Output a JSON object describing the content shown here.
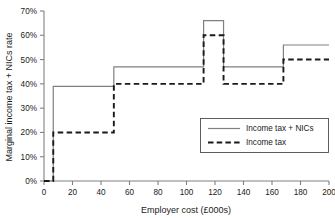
{
  "chart_data": {
    "type": "line",
    "title": "",
    "subtitle": "",
    "xlabel": "Employer cost (£000s)",
    "ylabel": "Marginal income tax + NICs rate",
    "xlim": [
      0,
      200
    ],
    "ylim": [
      0,
      0.7
    ],
    "grid": false,
    "legend_position": "inside-right",
    "x_ticks": [
      0,
      20,
      40,
      60,
      80,
      100,
      120,
      140,
      160,
      180,
      200
    ],
    "x_tick_labels": [
      "0",
      "20",
      "40",
      "60",
      "80",
      "100",
      "120",
      "140",
      "160",
      "180",
      "200"
    ],
    "y_ticks": [
      0,
      0.1,
      0.2,
      0.3,
      0.4,
      0.5,
      0.6,
      0.7
    ],
    "y_tick_labels": [
      "0%",
      "10%",
      "20%",
      "30%",
      "40%",
      "50%",
      "60%",
      "70%"
    ],
    "step_shape": "post",
    "series": [
      {
        "name": "Income tax + NICs",
        "style": "solid",
        "color": "#808080",
        "breakpoints": [
          0,
          6.5,
          49,
          112,
          126,
          168,
          200
        ],
        "values": [
          0.0,
          0.39,
          0.47,
          0.66,
          0.47,
          0.56
        ],
        "points": [
          {
            "x": 0,
            "y": 0.0
          },
          {
            "x": 6.5,
            "y": 0.0
          },
          {
            "x": 6.5,
            "y": 0.39
          },
          {
            "x": 49,
            "y": 0.39
          },
          {
            "x": 49,
            "y": 0.47
          },
          {
            "x": 112,
            "y": 0.47
          },
          {
            "x": 112,
            "y": 0.66
          },
          {
            "x": 126,
            "y": 0.66
          },
          {
            "x": 126,
            "y": 0.47
          },
          {
            "x": 168,
            "y": 0.47
          },
          {
            "x": 168,
            "y": 0.56
          },
          {
            "x": 200,
            "y": 0.56
          }
        ]
      },
      {
        "name": "Income tax",
        "style": "dashed",
        "color": "#1a1a1a",
        "breakpoints": [
          0,
          6.5,
          49,
          112,
          126,
          168,
          200
        ],
        "values": [
          0.0,
          0.2,
          0.4,
          0.6,
          0.4,
          0.5
        ],
        "points": [
          {
            "x": 0,
            "y": 0.0
          },
          {
            "x": 6.5,
            "y": 0.0
          },
          {
            "x": 6.5,
            "y": 0.2
          },
          {
            "x": 49,
            "y": 0.2
          },
          {
            "x": 49,
            "y": 0.4
          },
          {
            "x": 112,
            "y": 0.4
          },
          {
            "x": 112,
            "y": 0.6
          },
          {
            "x": 126,
            "y": 0.6
          },
          {
            "x": 126,
            "y": 0.4
          },
          {
            "x": 168,
            "y": 0.4
          },
          {
            "x": 168,
            "y": 0.5
          },
          {
            "x": 200,
            "y": 0.5
          }
        ]
      }
    ],
    "legend": [
      {
        "label": "Income tax + NICs",
        "style": "solid",
        "color": "#808080"
      },
      {
        "label": "Income tax",
        "style": "dashed",
        "color": "#1a1a1a"
      }
    ]
  }
}
